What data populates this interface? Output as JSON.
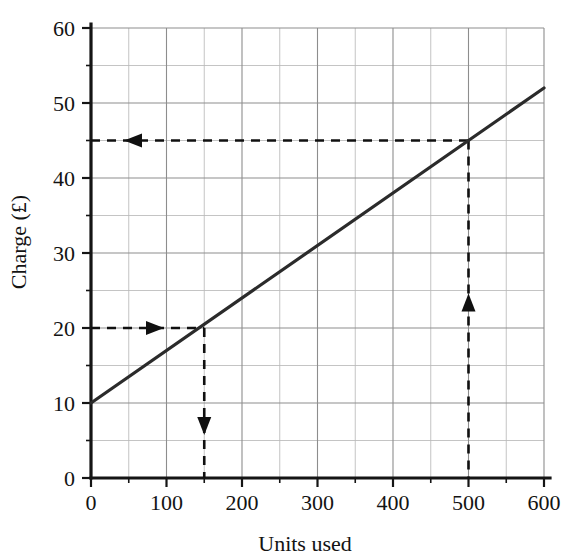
{
  "chart_data": {
    "type": "line",
    "title": "",
    "xlabel": "Units used",
    "ylabel": "Charge (£)",
    "xlim": [
      0,
      600
    ],
    "ylim": [
      0,
      60
    ],
    "x_ticks": [
      0,
      100,
      200,
      300,
      400,
      500,
      600
    ],
    "x_tick_labels": [
      "0",
      "100",
      "200",
      "300",
      "400",
      "500",
      "600"
    ],
    "y_ticks": [
      0,
      10,
      20,
      30,
      40,
      50,
      60
    ],
    "y_tick_labels": [
      "0",
      "10",
      "20",
      "30",
      "40",
      "50",
      "60"
    ],
    "x_minor_step": 50,
    "y_minor_step": 5,
    "grid": true,
    "legend": "none",
    "series": [
      {
        "name": "Charge",
        "x": [
          0,
          600
        ],
        "values": [
          10,
          52
        ],
        "equation": "Charge = 10 + 0.07 * Units",
        "intercept": 10,
        "slope": 0.07,
        "color": "#2b2b2b"
      }
    ],
    "annotations": [
      {
        "name": "read-off-units-to-charge",
        "description": "From 150 units up to the line, then left to read 20",
        "from": {
          "x": 150,
          "y": 0
        },
        "to": {
          "x": 0,
          "y": 20
        },
        "arrows": [
          "down-at-x-150",
          "right-at-y-20"
        ],
        "style": "dashed"
      },
      {
        "name": "read-off-charge-to-units",
        "description": "From 500 units up to the line, then left to read 45",
        "from": {
          "x": 500,
          "y": 0
        },
        "to": {
          "x": 0,
          "y": 45
        },
        "arrows": [
          "up-at-x-500",
          "left-at-y-45"
        ],
        "style": "dashed"
      }
    ],
    "annotated_points": [
      {
        "x": 150,
        "y": 20
      },
      {
        "x": 500,
        "y": 45
      }
    ]
  },
  "axes": {
    "x_title": "Units used",
    "y_title": "Charge (£)"
  },
  "colors": {
    "line": "#2b2b2b",
    "grid_major": "#8d8d8d",
    "grid_minor": "#b9b9b9",
    "axis": "#151515",
    "guide": "#101010",
    "background": "#ffffff"
  }
}
